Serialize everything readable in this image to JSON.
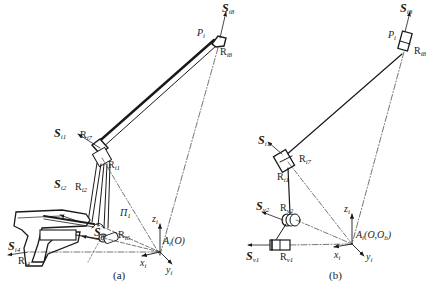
{
  "figure": {
    "panels": [
      {
        "id": "a",
        "caption": "(a)",
        "labels": {
          "s_i8": {
            "main": "S",
            "sub": "i8"
          },
          "p_i": {
            "main": "P",
            "sub": "i"
          },
          "r_i8": {
            "main": "R",
            "sub": "i8"
          },
          "s_i1": {
            "main": "S",
            "sub": "i1"
          },
          "r_i7": {
            "main": "R",
            "sub": "i7"
          },
          "r_i1": {
            "main": "R",
            "sub": "i1"
          },
          "s_i2": {
            "main": "S",
            "sub": "i2"
          },
          "r_i2": {
            "main": "R",
            "sub": "i2"
          },
          "pi_1": {
            "main": "Π",
            "sub": "1"
          },
          "s_i6": {
            "main": "S",
            "sub": "i6"
          },
          "r_i6": {
            "main": "R",
            "sub": "i6"
          },
          "s_i4": {
            "main": "S",
            "sub": "i4"
          },
          "r_i4": {
            "main": "R",
            "sub": "i4"
          },
          "z_i": {
            "main": "z",
            "sub": "i"
          },
          "x_i": {
            "main": "x",
            "sub": "i"
          },
          "y_i": {
            "main": "y",
            "sub": "i"
          },
          "origin": {
            "main": "A",
            "sub": "i",
            "suffix": "(O)"
          }
        }
      },
      {
        "id": "b",
        "caption": "(b)",
        "labels": {
          "s_i8": {
            "main": "S",
            "sub": "i8"
          },
          "p_i": {
            "main": "P",
            "sub": "i"
          },
          "r_i8": {
            "main": "R",
            "sub": "i8"
          },
          "s_i1": {
            "main": "S",
            "sub": "i1"
          },
          "r_i7": {
            "main": "R",
            "sub": "i7"
          },
          "r_i1": {
            "main": "R",
            "sub": "i1"
          },
          "s_v2": {
            "main": "S",
            "sub": "v2"
          },
          "r_v2": {
            "main": "R",
            "sub": "v2"
          },
          "s_v1": {
            "main": "S",
            "sub": "v1"
          },
          "r_v1": {
            "main": "R",
            "sub": "v1"
          },
          "z_i": {
            "main": "z",
            "sub": "i"
          },
          "x_i": {
            "main": "x",
            "sub": "i"
          },
          "y_i": {
            "main": "y",
            "sub": "i"
          },
          "origin": {
            "main": "A",
            "sub": "i",
            "suffix": "(O,O",
            "sub2": "b",
            "suffix2": ")"
          }
        }
      }
    ],
    "colors": {
      "ink": "#1a1a1a",
      "background": "#ffffff"
    }
  }
}
